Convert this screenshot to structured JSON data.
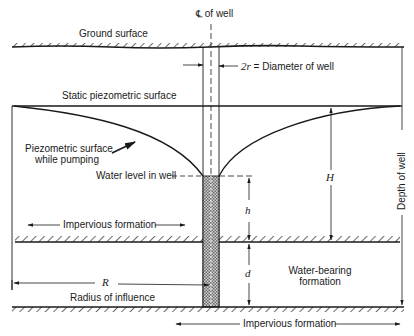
{
  "diagram": {
    "labels": {
      "centerline": "℄ of well",
      "ground_surface": "Ground surface",
      "diameter": "2r = Diameter of well",
      "diameter_var": "2r",
      "diameter_text": " = Diameter of well",
      "static_surface": "Static piezometric surface",
      "pumping_surface_line1": "Piezometric surface",
      "pumping_surface_line2": "while pumping",
      "water_level": "Water level in well",
      "impervious_upper": "Impervious formation",
      "impervious_lower": "Impervious formation",
      "water_bearing_line1": "Water-bearing",
      "water_bearing_line2": "formation",
      "radius_var": "R",
      "radius_text": "Radius of influence",
      "H": "H",
      "h": "h",
      "d": "d",
      "depth_of_well": "Depth of well"
    },
    "colors": {
      "ink": "#1a1a1a",
      "gravel": "#9a9a9a",
      "background": "#ffffff"
    }
  }
}
